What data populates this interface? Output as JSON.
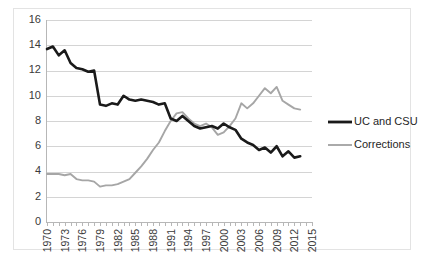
{
  "chart_data": {
    "type": "line",
    "title": "",
    "xlabel": "",
    "ylabel": "",
    "xlim": [
      1970,
      2015
    ],
    "ylim": [
      0,
      16
    ],
    "yticks": [
      0,
      2,
      4,
      6,
      8,
      10,
      12,
      14,
      16
    ],
    "xticks": [
      1970,
      1973,
      1976,
      1979,
      1982,
      1985,
      1988,
      1991,
      1994,
      1997,
      2000,
      2003,
      2006,
      2009,
      2012,
      2015
    ],
    "x_tick_step_minor": 1,
    "grid": "horizontal",
    "legend_position": "right",
    "x": [
      1970,
      1971,
      1972,
      1973,
      1974,
      1975,
      1976,
      1977,
      1978,
      1979,
      1980,
      1981,
      1982,
      1983,
      1984,
      1985,
      1986,
      1987,
      1988,
      1989,
      1990,
      1991,
      1992,
      1993,
      1994,
      1995,
      1996,
      1997,
      1998,
      1999,
      2000,
      2001,
      2002,
      2003,
      2004,
      2005,
      2006,
      2007,
      2008,
      2009,
      2010,
      2011,
      2012,
      2013
    ],
    "series": [
      {
        "name": "UC and CSU",
        "color": "#1a1a1a",
        "values": [
          13.7,
          13.9,
          13.2,
          13.6,
          12.6,
          12.2,
          12.1,
          11.9,
          12.0,
          9.3,
          9.2,
          9.4,
          9.3,
          10.0,
          9.7,
          9.6,
          9.7,
          9.6,
          9.5,
          9.3,
          9.4,
          8.2,
          8.0,
          8.4,
          8.0,
          7.6,
          7.4,
          7.5,
          7.6,
          7.4,
          7.8,
          7.5,
          7.3,
          6.6,
          6.3,
          6.1,
          5.7,
          5.9,
          5.5,
          6.0,
          5.2,
          5.6,
          5.1,
          5.2
        ]
      },
      {
        "name": "Corrections",
        "color": "#a6a6a6",
        "values": [
          3.8,
          3.8,
          3.8,
          3.7,
          3.8,
          3.4,
          3.3,
          3.3,
          3.2,
          2.8,
          2.9,
          2.9,
          3.0,
          3.2,
          3.4,
          3.9,
          4.4,
          5.0,
          5.7,
          6.3,
          7.2,
          8.0,
          8.6,
          8.7,
          8.2,
          7.8,
          7.6,
          7.8,
          7.5,
          6.9,
          7.1,
          7.6,
          8.2,
          9.4,
          9.0,
          9.4,
          10.0,
          10.6,
          10.2,
          10.7,
          9.6,
          9.3,
          9.0,
          8.9
        ]
      }
    ]
  },
  "legend": {
    "items": [
      {
        "label": "UC and CSU"
      },
      {
        "label": "Corrections"
      }
    ]
  },
  "axes": {
    "y_labels": [
      "16",
      "14",
      "12",
      "10",
      "8",
      "6",
      "4",
      "2",
      "0"
    ],
    "x_labels": [
      "1970",
      "1973",
      "1976",
      "1979",
      "1982",
      "1985",
      "1988",
      "1991",
      "1994",
      "1997",
      "2000",
      "2003",
      "2006",
      "2009",
      "2012",
      "2015"
    ]
  },
  "colors": {
    "uc_and_csu": "#1a1a1a",
    "corrections": "#a6a6a6",
    "grid": "#d4d4d4",
    "axis": "#b7b7b7",
    "background": "#ffffff"
  }
}
